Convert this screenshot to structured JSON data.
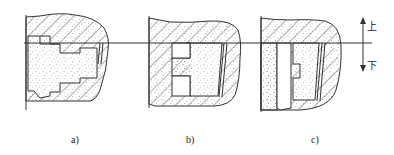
{
  "figure": {
    "panels": [
      {
        "id": "a",
        "label": "a)",
        "description": "stepped cavity, sand core at left, pattern mostly below parting line"
      },
      {
        "id": "b",
        "label": "b)",
        "description": "rectangular cavity with two side recesses, parting line at top"
      },
      {
        "id": "c",
        "label": "c)",
        "description": "cavity below parting line with stepped profile on left side"
      }
    ],
    "direction_indicator": {
      "up_label": "上",
      "down_label": "下"
    },
    "colors": {
      "line": "#333333",
      "hatch": "#555555",
      "sand_dot": "#666666",
      "background": "#ffffff"
    }
  }
}
